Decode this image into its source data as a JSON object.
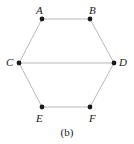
{
  "figure": {
    "caption": "(b)",
    "background_color": "#ffffff",
    "edge_color": "#b9b9b9",
    "vertex_color": "#1a1a1a",
    "label_color": "#1a1a1a"
  },
  "chart_data": {
    "type": "diagram",
    "title": "(b)",
    "subtitle": "",
    "xlabel": "",
    "ylabel": "",
    "graph_kind": "hexagonal graph with horizontal chord",
    "vertex_count": 6,
    "edge_count": 7,
    "nodes": [
      {
        "id": "A",
        "label": "A",
        "x": 42,
        "y": 19,
        "label_x": 36,
        "label_y": 5
      },
      {
        "id": "B",
        "label": "B",
        "x": 90,
        "y": 19,
        "label_x": 89,
        "label_y": 5
      },
      {
        "id": "C",
        "label": "C",
        "x": 19,
        "y": 63,
        "label_x": 6,
        "label_y": 57
      },
      {
        "id": "D",
        "label": "D",
        "x": 114,
        "y": 63,
        "label_x": 119,
        "label_y": 57
      },
      {
        "id": "E",
        "label": "E",
        "x": 42,
        "y": 107,
        "label_x": 36,
        "label_y": 113
      },
      {
        "id": "F",
        "label": "F",
        "x": 90,
        "y": 107,
        "label_x": 89,
        "label_y": 113
      }
    ],
    "edges": [
      {
        "from": "A",
        "to": "B"
      },
      {
        "from": "A",
        "to": "C"
      },
      {
        "from": "B",
        "to": "D"
      },
      {
        "from": "C",
        "to": "D"
      },
      {
        "from": "C",
        "to": "E"
      },
      {
        "from": "D",
        "to": "F"
      },
      {
        "from": "E",
        "to": "F"
      }
    ]
  }
}
